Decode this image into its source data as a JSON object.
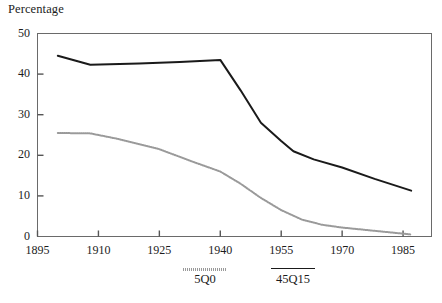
{
  "chart_data": {
    "type": "line",
    "title": "",
    "ylabel": "Percentage",
    "xlabel": "",
    "ylim": [
      0,
      50
    ],
    "xlim": [
      1895,
      1992
    ],
    "yticks": [
      0,
      10,
      20,
      30,
      40,
      50
    ],
    "xticks": [
      1895,
      1910,
      1925,
      1940,
      1955,
      1970,
      1985
    ],
    "grid": false,
    "legend_position": "bottom",
    "series": [
      {
        "name": "45Q15",
        "style": "solid",
        "color": "#1a1a1a",
        "points": [
          [
            1900,
            44.5
          ],
          [
            1908,
            42.3
          ],
          [
            1920,
            42.6
          ],
          [
            1930,
            43.0
          ],
          [
            1940,
            43.5
          ],
          [
            1945,
            36.0
          ],
          [
            1950,
            28.0
          ],
          [
            1955,
            23.5
          ],
          [
            1958,
            21.0
          ],
          [
            1963,
            19.0
          ],
          [
            1970,
            17.0
          ],
          [
            1978,
            14.2
          ],
          [
            1987,
            11.3
          ]
        ]
      },
      {
        "name": "5Q0",
        "style": "dotted",
        "color": "#9a9a9a",
        "points": [
          [
            1900,
            25.5
          ],
          [
            1908,
            25.4
          ],
          [
            1915,
            24.0
          ],
          [
            1925,
            21.5
          ],
          [
            1933,
            18.5
          ],
          [
            1940,
            16.0
          ],
          [
            1945,
            13.0
          ],
          [
            1950,
            9.5
          ],
          [
            1955,
            6.5
          ],
          [
            1960,
            4.2
          ],
          [
            1965,
            2.9
          ],
          [
            1970,
            2.2
          ],
          [
            1978,
            1.4
          ],
          [
            1987,
            0.5
          ]
        ]
      }
    ]
  },
  "yaxis": {
    "labels": [
      "50",
      "40",
      "30",
      "20",
      "10",
      "0"
    ]
  },
  "xaxis": {
    "labels": [
      "1895",
      "1910",
      "1925",
      "1940",
      "1955",
      "1970",
      "1985"
    ]
  },
  "legend": {
    "entries": [
      {
        "label": "5Q0",
        "style": "dotted"
      },
      {
        "label": "45Q15",
        "style": "solid"
      }
    ]
  },
  "header": {
    "axis_title": "Percentage"
  },
  "colors": {
    "series_solid": "#1a1a1a",
    "series_dotted": "#9a9a9a",
    "axis": "#555555",
    "text": "#1c1c1c",
    "background": "#ffffff"
  }
}
